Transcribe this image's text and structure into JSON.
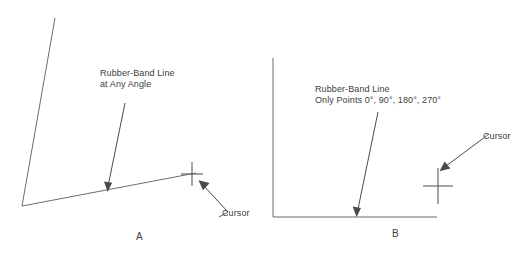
{
  "figure": {
    "background_color": "#ffffff",
    "ink_color": "#4a4a4a"
  },
  "panel_a": {
    "caption": "A",
    "callout_label_line1": "Rubber-Band Line",
    "callout_label_line2": "at Any Angle",
    "cursor_label": "Cursor"
  },
  "panel_b": {
    "caption": "B",
    "callout_label_line1": "Rubber-Band Line",
    "callout_label_line2": "Only Points 0°, 90°, 180°, 270°",
    "cursor_label": "Cursor"
  }
}
